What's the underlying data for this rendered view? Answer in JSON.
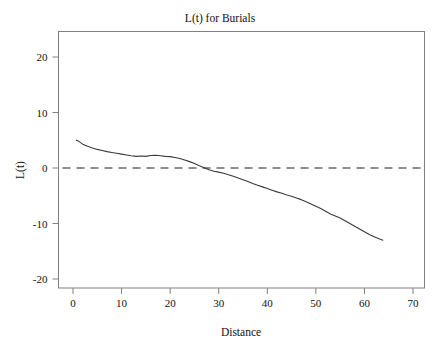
{
  "chart_data": {
    "type": "line",
    "title": "L(t) for Burials",
    "xlabel": "Distance",
    "ylabel": "L(t)",
    "xlim": [
      -2,
      72
    ],
    "ylim": [
      -22.5,
      24
    ],
    "xticks": [
      0,
      10,
      20,
      30,
      40,
      50,
      60,
      70
    ],
    "xtick_labels": [
      "0",
      "10",
      "20",
      "30",
      "40",
      "50",
      "60",
      "70"
    ],
    "yticks": [
      20,
      10,
      0,
      -10,
      -20
    ],
    "ytick_labels": [
      "20",
      "10",
      "0",
      "-10",
      "-20"
    ],
    "grid": false,
    "legend": "none",
    "frame": true,
    "series": [
      {
        "name": "L(t) observed",
        "style": "solid",
        "color": "#3a3a3a",
        "x": [
          0.7,
          1.2,
          2.0,
          3.0,
          4.0,
          5.0,
          6.0,
          7.0,
          8.0,
          9.0,
          10.0,
          11.0,
          12.0,
          13.0,
          14.0,
          15.0,
          16.0,
          17.0,
          18.0,
          19.0,
          20.0,
          21.0,
          22.0,
          23.0,
          24.0,
          25.0,
          26.0,
          27.0,
          28.0,
          29.0,
          30.0,
          31.0,
          32.0,
          33.0,
          34.0,
          35.0,
          36.0,
          37.0,
          38.0,
          39.0,
          40.0,
          41.0,
          42.0,
          43.0,
          44.0,
          45.0,
          46.0,
          47.0,
          48.0,
          49.0,
          50.0,
          51.0,
          52.0,
          53.0,
          54.0,
          55.0,
          56.0,
          57.0,
          58.0,
          59.0,
          60.0,
          61.0,
          62.0,
          63.0,
          63.8
        ],
        "y": [
          5.0,
          4.8,
          4.3,
          3.9,
          3.6,
          3.35,
          3.15,
          2.95,
          2.8,
          2.65,
          2.5,
          2.35,
          2.2,
          2.1,
          2.15,
          2.1,
          2.25,
          2.3,
          2.2,
          2.1,
          2.05,
          1.9,
          1.7,
          1.45,
          1.15,
          0.8,
          0.4,
          0.05,
          -0.3,
          -0.6,
          -0.75,
          -0.95,
          -1.2,
          -1.5,
          -1.8,
          -2.1,
          -2.45,
          -2.8,
          -3.1,
          -3.4,
          -3.7,
          -4.0,
          -4.3,
          -4.55,
          -4.85,
          -5.1,
          -5.4,
          -5.7,
          -6.1,
          -6.5,
          -6.9,
          -7.3,
          -7.8,
          -8.3,
          -8.65,
          -9.0,
          -9.5,
          -10.0,
          -10.5,
          -11.0,
          -11.5,
          -12.0,
          -12.4,
          -12.75,
          -13.0
        ]
      },
      {
        "name": "reference L(t) = 0",
        "style": "dashed",
        "color": "#6b6b6b",
        "constant_y": 0
      }
    ]
  }
}
